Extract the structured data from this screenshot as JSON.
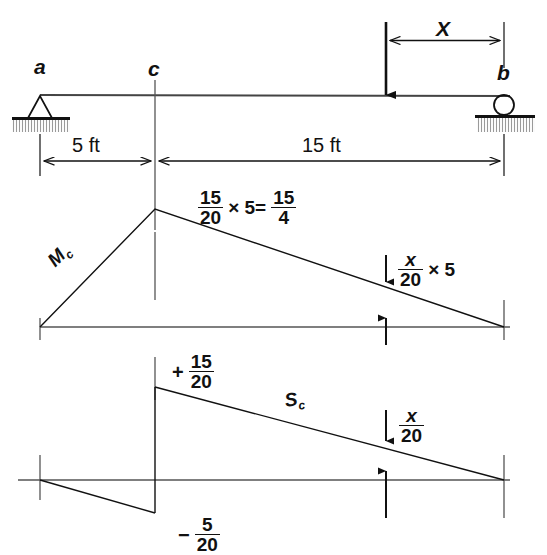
{
  "figure": {
    "type": "influence-line-diagram",
    "beam": {
      "support_left_label": "a",
      "support_left_type": "pin-support",
      "support_right_label": "b",
      "support_right_type": "roller-support",
      "point_label": "c",
      "load_label": "X",
      "dimensions": [
        {
          "label": "5 ft",
          "from": "a",
          "to": "c"
        },
        {
          "label": "15 ft",
          "from": "c",
          "to": "b"
        }
      ]
    },
    "moment_diagram": {
      "curve_label": "M",
      "curve_subscript": "c",
      "peak_expression": {
        "left_fraction": {
          "numerator": "15",
          "denominator": "20"
        },
        "operator": "× 5=",
        "right_fraction": {
          "numerator": "15",
          "denominator": "4"
        }
      },
      "ordinate_expression": {
        "fraction": {
          "numerator": "x",
          "denominator": "20"
        },
        "operator": "× 5"
      }
    },
    "shear_diagram": {
      "curve_label": "S",
      "curve_subscript": "c",
      "positive_value": {
        "sign": "+",
        "fraction": {
          "numerator": "15",
          "denominator": "20"
        }
      },
      "negative_value": {
        "sign": "−",
        "fraction": {
          "numerator": "5",
          "denominator": "20"
        }
      },
      "ordinate_expression": {
        "fraction": {
          "numerator": "x",
          "denominator": "20"
        }
      }
    },
    "colors": {
      "line": "#111111",
      "hatch": "#8d8d8d",
      "background": "#ffffff"
    }
  }
}
